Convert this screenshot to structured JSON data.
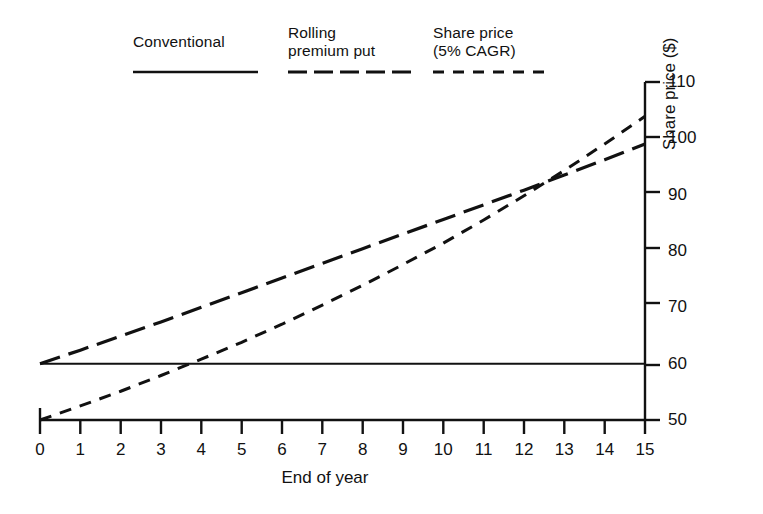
{
  "chart_data": {
    "type": "line",
    "title": "",
    "xlabel": "End of year",
    "ylabel": "Share price ($)",
    "xlim": [
      0,
      15
    ],
    "ylim": [
      50,
      110
    ],
    "grid": false,
    "legend_position": "top",
    "xticks": [
      "0",
      "1",
      "2",
      "3",
      "4",
      "5",
      "6",
      "7",
      "8",
      "9",
      "10",
      "11",
      "12",
      "13",
      "14",
      "15"
    ],
    "yticks": [
      "50",
      "60",
      "70",
      "80",
      "90",
      "100",
      "110"
    ],
    "x": [
      0,
      1,
      2,
      3,
      4,
      5,
      6,
      7,
      8,
      9,
      10,
      11,
      12,
      13,
      14,
      15
    ],
    "series": [
      {
        "name": "Conventional",
        "style": "solid",
        "color": "#111111",
        "values": [
          60,
          60,
          60,
          60,
          60,
          60,
          60,
          60,
          60,
          60,
          60,
          60,
          60,
          60,
          60,
          60
        ]
      },
      {
        "name": "Rolling premium put",
        "style": "long-dash",
        "color": "#111111",
        "values": [
          60,
          62.4,
          64.9,
          67.4,
          70.0,
          72.6,
          75.2,
          77.8,
          80.4,
          83.0,
          85.6,
          88.2,
          90.8,
          93.5,
          96.2,
          99.0
        ]
      },
      {
        "name": "Share price (5% CAGR)",
        "style": "short-dash",
        "color": "#111111",
        "values": [
          50,
          52.5,
          55.1,
          57.9,
          60.8,
          63.8,
          67.0,
          70.4,
          73.9,
          77.6,
          81.4,
          85.5,
          89.8,
          94.3,
          99.0,
          103.9
        ]
      }
    ],
    "annotations": [
      "Share price crosses the conventional level of $60 at about year 4",
      "Rolling premium put and share price curves cross at about year 9.7 near $81"
    ]
  },
  "legend": {
    "items": [
      {
        "label": "Conventional",
        "style": "solid"
      },
      {
        "label": "Rolling\npremium put",
        "style": "long-dash"
      },
      {
        "label": "Share price\n(5% CAGR)",
        "style": "short-dash"
      }
    ]
  }
}
